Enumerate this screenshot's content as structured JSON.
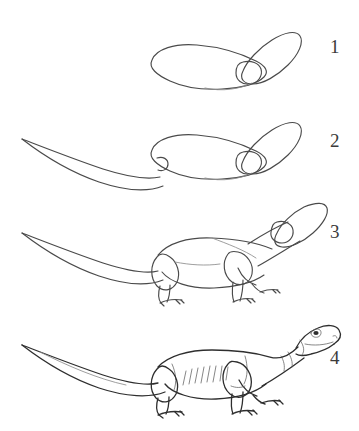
{
  "page": {
    "background_color": "#ffffff",
    "ink_color": "#4a4a4a",
    "light_ink_color": "#8d8d8d",
    "number_color": "#3b3b3b",
    "width": 359,
    "height": 431
  },
  "steps": [
    {
      "number": "1",
      "label": "Step 1",
      "description": "Draw a curved bean-shaped body oval and an angled oval for the head with a small circle guide at the jaw.",
      "shapes": [
        "body-oval",
        "head-oval",
        "jaw-circle"
      ]
    },
    {
      "number": "2",
      "label": "Step 2",
      "description": "Add the long tapering tail curving down and to the left, joined to the body with a small hook.",
      "shapes": [
        "body-oval",
        "head-oval",
        "jaw-circle",
        "tail-taper",
        "hip-hook"
      ]
    },
    {
      "number": "3",
      "label": "Step 3",
      "description": "Sketch the neck connecting head to body, then block in the front and hind legs with teardrop thighs, lower legs and clawed feet.",
      "shapes": [
        "body-outline",
        "head-oval",
        "jaw-circle",
        "tail-taper",
        "neck-line",
        "hind-leg",
        "front-leg-near",
        "front-leg-far",
        "feet-claws"
      ]
    },
    {
      "number": "4",
      "label": "Step 4",
      "description": "Finish the outline: refine the snout with eye, nostril and mouth, add flank hatching for the ribs, define the limbs and erase the guides.",
      "shapes": [
        "final-outline",
        "head-detail",
        "eye",
        "nostril",
        "mouth-line",
        "rib-hatching",
        "legs",
        "clawed-feet",
        "tail"
      ]
    }
  ]
}
